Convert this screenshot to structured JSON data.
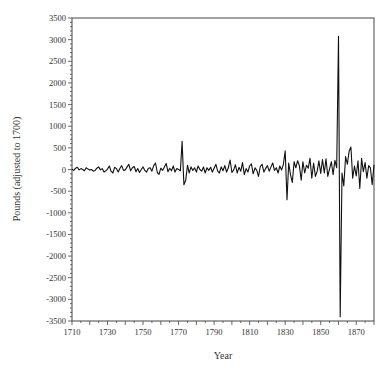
{
  "chart_data": {
    "type": "line",
    "title": "",
    "xlabel": "Year",
    "ylabel": "Pounds (adjusted to 1700)",
    "xlim": [
      1710,
      1880
    ],
    "ylim": [
      -3500,
      3500
    ],
    "grid": false,
    "legend": null,
    "x_ticks": [
      1710,
      1730,
      1750,
      1770,
      1790,
      1810,
      1830,
      1850,
      1870
    ],
    "y_ticks": [
      3500,
      3000,
      2500,
      2000,
      1500,
      1000,
      500,
      0,
      -500,
      -1000,
      -1500,
      -2000,
      -2500,
      -3000,
      -3500
    ],
    "series": [
      {
        "name": "Pounds",
        "color": "#111111",
        "x": [
          1710,
          1711,
          1712,
          1713,
          1714,
          1715,
          1716,
          1717,
          1718,
          1719,
          1720,
          1721,
          1722,
          1723,
          1724,
          1725,
          1726,
          1727,
          1728,
          1729,
          1730,
          1731,
          1732,
          1733,
          1734,
          1735,
          1736,
          1737,
          1738,
          1739,
          1740,
          1741,
          1742,
          1743,
          1744,
          1745,
          1746,
          1747,
          1748,
          1749,
          1750,
          1751,
          1752,
          1753,
          1754,
          1755,
          1756,
          1757,
          1758,
          1759,
          1760,
          1761,
          1762,
          1763,
          1764,
          1765,
          1766,
          1767,
          1768,
          1769,
          1770,
          1771,
          1772,
          1773,
          1774,
          1775,
          1776,
          1777,
          1778,
          1779,
          1780,
          1781,
          1782,
          1783,
          1784,
          1785,
          1786,
          1787,
          1788,
          1789,
          1790,
          1791,
          1792,
          1793,
          1794,
          1795,
          1796,
          1797,
          1798,
          1799,
          1800,
          1801,
          1802,
          1803,
          1804,
          1805,
          1806,
          1807,
          1808,
          1809,
          1810,
          1811,
          1812,
          1813,
          1814,
          1815,
          1816,
          1817,
          1818,
          1819,
          1820,
          1821,
          1822,
          1823,
          1824,
          1825,
          1826,
          1827,
          1828,
          1829,
          1830,
          1831,
          1832,
          1833,
          1834,
          1835,
          1836,
          1837,
          1838,
          1839,
          1840,
          1841,
          1842,
          1843,
          1844,
          1845,
          1846,
          1847,
          1848,
          1849,
          1850,
          1851,
          1852,
          1853,
          1854,
          1855,
          1856,
          1857,
          1858,
          1859,
          1860,
          1861,
          1862,
          1863,
          1864,
          1865,
          1866,
          1867,
          1868,
          1869,
          1870,
          1871,
          1872,
          1873,
          1874,
          1875,
          1876,
          1877,
          1878,
          1879,
          1880
        ],
        "values": [
          10,
          -20,
          30,
          50,
          -10,
          20,
          0,
          -30,
          40,
          10,
          -10,
          0,
          -40,
          -20,
          30,
          60,
          -10,
          20,
          -60,
          -30,
          10,
          80,
          -40,
          -80,
          50,
          20,
          -60,
          30,
          90,
          -20,
          -10,
          60,
          120,
          -30,
          40,
          70,
          -50,
          20,
          -70,
          0,
          60,
          -20,
          -60,
          30,
          40,
          -40,
          90,
          150,
          -70,
          -110,
          30,
          -20,
          60,
          140,
          -50,
          30,
          -30,
          80,
          -60,
          20,
          0,
          -30,
          650,
          -350,
          -250,
          100,
          -80,
          60,
          -20,
          40,
          -60,
          80,
          0,
          -40,
          60,
          -80,
          40,
          -20,
          50,
          -60,
          30,
          120,
          -40,
          -80,
          60,
          -30,
          90,
          -60,
          40,
          220,
          -70,
          -10,
          110,
          -80,
          50,
          -40,
          160,
          -120,
          20,
          -60,
          80,
          130,
          -100,
          40,
          -20,
          -160,
          70,
          120,
          -60,
          20,
          90,
          -40,
          60,
          150,
          -20,
          40,
          -80,
          80,
          -10,
          120,
          430,
          -700,
          150,
          -120,
          -300,
          180,
          40,
          200,
          90,
          -250,
          180,
          -80,
          100,
          30,
          260,
          -200,
          150,
          -160,
          -40,
          200,
          -90,
          230,
          -80,
          250,
          -160,
          20,
          180,
          -120,
          210,
          40,
          3080,
          -3400,
          -80,
          -380,
          300,
          120,
          420,
          520,
          -200,
          80,
          -150,
          200,
          -440,
          260,
          -50,
          160,
          -200,
          90,
          40,
          -350,
          110
        ]
      }
    ]
  },
  "axes": {
    "x_title": "Year",
    "y_title": "Pounds (adjusted to 1700)"
  }
}
